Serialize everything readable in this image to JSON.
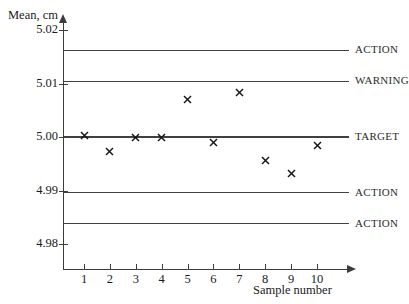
{
  "top_caption": "",
  "axes": {
    "y_title": "Mean, cm",
    "x_title": "Sample number",
    "y_ticks": [
      {
        "label": "5.02",
        "value": 5.02
      },
      {
        "label": "5.01",
        "value": 5.01
      },
      {
        "label": "5.00",
        "value": 5.0
      },
      {
        "label": "4.99",
        "value": 4.99
      },
      {
        "label": "4.98",
        "value": 4.98
      }
    ],
    "x_ticks": [
      "1",
      "2",
      "3",
      "4",
      "5",
      "6",
      "7",
      "8",
      "9",
      "10"
    ]
  },
  "limits": [
    {
      "label": "ACTION",
      "value": 5.0162
    },
    {
      "label": "WARNING",
      "value": 5.0104
    },
    {
      "label": "TARGET",
      "value": 5.0
    },
    {
      "label": "ACTION",
      "value": 4.9896
    },
    {
      "label": "ACTION",
      "value": 4.9838
    }
  ],
  "chart_data": {
    "type": "scatter",
    "title": "",
    "xlabel": "Sample number",
    "ylabel": "Mean, cm",
    "xlim": [
      0.5,
      10.8
    ],
    "ylim": [
      4.9755,
      5.0225
    ],
    "grid": false,
    "legend": "none",
    "marker": "x",
    "marker_color": "#161616",
    "categories": [
      1,
      2,
      3,
      4,
      5,
      6,
      7,
      8,
      9,
      10
    ],
    "x": [
      1,
      2,
      3,
      4,
      5,
      6,
      7,
      8,
      9,
      10
    ],
    "values": [
      5.0002,
      4.9973,
      5.0,
      5.0,
      5.007,
      4.999,
      5.0084,
      4.9957,
      4.9932,
      4.9985
    ],
    "series": [
      {
        "name": "Sample mean",
        "values": [
          5.0002,
          4.9973,
          5.0,
          5.0,
          5.007,
          4.999,
          5.0084,
          4.9957,
          4.9932,
          4.9985
        ]
      }
    ],
    "annotations": [
      {
        "text": "ACTION",
        "y": 5.0162,
        "position": "right"
      },
      {
        "text": "WARNING",
        "y": 5.0104,
        "position": "right"
      },
      {
        "text": "TARGET",
        "y": 5.0,
        "position": "right"
      },
      {
        "text": "ACTION",
        "y": 4.9896,
        "position": "right"
      },
      {
        "text": "ACTION",
        "y": 4.9838,
        "position": "right"
      }
    ],
    "reference_lines": [
      {
        "label": "ACTION",
        "y": 5.0162
      },
      {
        "label": "WARNING",
        "y": 5.0104
      },
      {
        "label": "TARGET",
        "y": 5.0
      },
      {
        "label": "ACTION",
        "y": 4.9896
      },
      {
        "label": "ACTION",
        "y": 4.9838
      }
    ],
    "ytick_labels": [
      "5.02",
      "5.01",
      "5.00",
      "4.99",
      "4.98"
    ],
    "ytick_values": [
      5.02,
      5.01,
      5.0,
      4.99,
      4.98
    ],
    "xtick_labels": [
      "1",
      "2",
      "3",
      "4",
      "5",
      "6",
      "7",
      "8",
      "9",
      "10"
    ],
    "xtick_values": [
      1,
      2,
      3,
      4,
      5,
      6,
      7,
      8,
      9,
      10
    ]
  }
}
